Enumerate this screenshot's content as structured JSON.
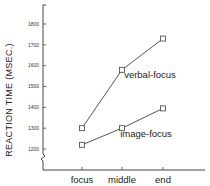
{
  "chart_data": {
    "type": "line",
    "title": "",
    "xlabel": "",
    "ylabel": "REACTION TIME (MSEC.)",
    "categories": [
      "focus",
      "middle",
      "end"
    ],
    "y_ticks": [
      1200,
      1300,
      1400,
      1500,
      1600,
      1700,
      1800
    ],
    "ylim": [
      1100,
      1900
    ],
    "y_axis_break": true,
    "grid": false,
    "legend": "inline labels next to lines",
    "series": [
      {
        "name": "verbal-focus",
        "values": [
          1300,
          1580,
          1730
        ],
        "marker": "open-square"
      },
      {
        "name": "image-focus",
        "values": [
          1220,
          1300,
          1395
        ],
        "marker": "open-square"
      }
    ]
  },
  "colors": {
    "line": "#555555",
    "axis": "#444444",
    "text": "#222222",
    "background": "#ffffff"
  }
}
